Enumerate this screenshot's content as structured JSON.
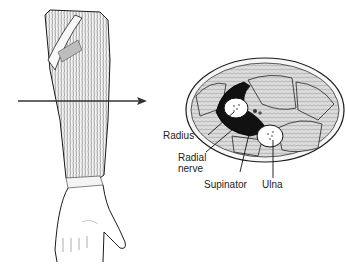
{
  "figure": {
    "left_panel": "forearm-muscles-anterior-view",
    "right_panel": "forearm-cross-section",
    "arrow": "section-level-indicator-arrow"
  },
  "labels": {
    "radius": "Radius",
    "radial_nerve_line1": "Radial",
    "radial_nerve_line2": "nerve",
    "supinator": "Supinator",
    "ulna": "Ulna"
  },
  "colors": {
    "ink": "#1a1a1a",
    "muscle_fill": "#d8d8d8",
    "supinator_fill": "#111111",
    "bone_fill": "#ffffff",
    "background": "#ffffff"
  }
}
